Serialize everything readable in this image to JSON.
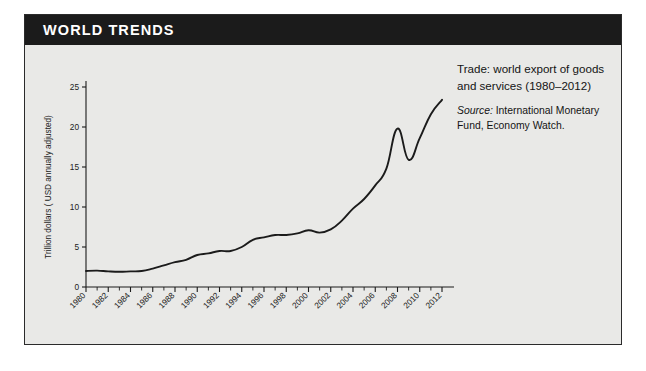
{
  "header": {
    "title": "WORLD TRENDS"
  },
  "caption": {
    "title": "Trade: world export of goods and services (1980–2012)",
    "source_label": "Source:",
    "source_text": " International Monetary Fund, Economy Watch."
  },
  "colors": {
    "title_bar": "#1b1b1b",
    "title_text": "#ffffff",
    "panel_background": "#e9e9e7",
    "panel_border": "#2b2b2b",
    "line": "#1b1b1b",
    "axis": "#1b1b1b"
  },
  "chart_data": {
    "type": "line",
    "title": "Trade: world export of goods and services (1980–2012)",
    "xlabel": "",
    "ylabel": "Trillion dollars ( USD annually adjusted)",
    "xlim": [
      1980,
      2012
    ],
    "ylim": [
      0,
      25
    ],
    "yticks": [
      0,
      5,
      10,
      15,
      20,
      25
    ],
    "ytick_labels": [
      "0",
      "5",
      "10",
      "15",
      "20",
      "25"
    ],
    "xticks": [
      1980,
      1982,
      1984,
      1986,
      1988,
      1990,
      1992,
      1994,
      1996,
      1998,
      2000,
      2002,
      2004,
      2006,
      2008,
      2010,
      2012
    ],
    "xtick_labels": [
      "1980",
      "1982",
      "1984",
      "1986",
      "1988",
      "1990",
      "1992",
      "1994",
      "1996",
      "1998",
      "2000",
      "2002",
      "2004",
      "2006",
      "2008",
      "2010",
      "2012"
    ],
    "x_minor_interval": 1,
    "grid": false,
    "legend": false,
    "x": [
      1980,
      1981,
      1982,
      1983,
      1984,
      1985,
      1986,
      1987,
      1988,
      1989,
      1990,
      1991,
      1992,
      1993,
      1994,
      1995,
      1996,
      1997,
      1998,
      1999,
      2000,
      2001,
      2002,
      2003,
      2004,
      2005,
      2006,
      2007,
      2008,
      2009,
      2010,
      2011,
      2012
    ],
    "values": [
      2.0,
      2.05,
      1.95,
      1.9,
      1.95,
      2.0,
      2.3,
      2.7,
      3.1,
      3.4,
      4.0,
      4.2,
      4.5,
      4.5,
      5.0,
      5.9,
      6.2,
      6.5,
      6.5,
      6.7,
      7.1,
      6.8,
      7.2,
      8.3,
      9.8,
      11.0,
      12.7,
      14.8,
      19.8,
      15.9,
      18.6,
      21.6,
      23.4
    ],
    "annotations": [
      {
        "year": 2008,
        "value": 19.8,
        "note": "pre-crisis peak"
      },
      {
        "year": 2009,
        "value": 15.9,
        "note": "financial crisis trough"
      },
      {
        "year": 2012,
        "value": 23.4,
        "note": "series end"
      }
    ]
  }
}
